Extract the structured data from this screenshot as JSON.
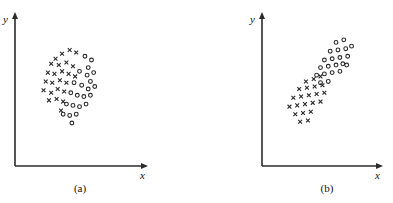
{
  "figure": {
    "background_color": "#ffffff",
    "ink_color": "#2b2b2b",
    "panels": [
      {
        "id": "a",
        "caption": "(a)",
        "caption_x": 80,
        "caption_y": 182,
        "axes": {
          "origin_x": 15,
          "origin_y": 166,
          "x_axis_end": 148,
          "y_axis_top": 12,
          "x_label": "x",
          "y_label": "y",
          "x_label_x": 140,
          "x_label_y": 170,
          "y_label_x": 3,
          "y_label_y": 14,
          "arrowheads": true,
          "ticks": false,
          "grid": false
        },
        "chart": {
          "description": "Two overlapping classes forming one roughly circular cloud; class x on the left, class o on the right, strongly intermixed."
        }
      },
      {
        "id": "b",
        "caption": "(b)",
        "caption_x": 327,
        "caption_y": 182,
        "axes": {
          "origin_x": 262,
          "origin_y": 166,
          "x_axis_end": 383,
          "y_axis_top": 12,
          "x_label": "x",
          "y_label": "y",
          "x_label_x": 375,
          "x_label_y": 170,
          "y_label_x": 250,
          "y_label_y": 14,
          "arrowheads": true,
          "ticks": false,
          "grid": false
        },
        "chart": {
          "description": "Two classes forming one elongated diagonal cloud; class x at the lower-left end, class o at the upper-right end, well separated along the major axis."
        }
      }
    ]
  },
  "chart_data": [
    {
      "type": "scatter",
      "panel": "a",
      "title": "(a)",
      "xlabel": "x",
      "ylabel": "y",
      "xlim": [
        0,
        100
      ],
      "ylim": [
        0,
        100
      ],
      "grid": false,
      "axis_ticks": false,
      "legend": null,
      "series": [
        {
          "name": "class-x",
          "marker": "x",
          "color": "#2b2b2b",
          "points": [
            [
              28,
              74
            ],
            [
              34,
              78
            ],
            [
              41,
              81
            ],
            [
              47,
              79
            ],
            [
              24,
              70
            ],
            [
              31,
              69
            ],
            [
              38,
              71
            ],
            [
              44,
              68
            ],
            [
              21,
              63
            ],
            [
              27,
              62
            ],
            [
              34,
              64
            ],
            [
              40,
              62
            ],
            [
              46,
              60
            ],
            [
              19,
              56
            ],
            [
              25,
              55
            ],
            [
              32,
              57
            ],
            [
              38,
              55
            ],
            [
              17,
              49
            ],
            [
              24,
              47
            ],
            [
              30,
              50
            ],
            [
              36,
              48
            ],
            [
              22,
              41
            ],
            [
              29,
              42
            ],
            [
              35,
              40
            ],
            [
              33,
              33
            ]
          ]
        },
        {
          "name": "class-o",
          "marker": "o",
          "color": "#2b2b2b",
          "points": [
            [
              55,
              76
            ],
            [
              61,
              73
            ],
            [
              58,
              67
            ],
            [
              50,
              64
            ],
            [
              57,
              61
            ],
            [
              63,
              63
            ],
            [
              60,
              56
            ],
            [
              45,
              55
            ],
            [
              52,
              53
            ],
            [
              58,
              50
            ],
            [
              64,
              52
            ],
            [
              42,
              47
            ],
            [
              48,
              45
            ],
            [
              54,
              44
            ],
            [
              60,
              45
            ],
            [
              38,
              38
            ],
            [
              44,
              37
            ],
            [
              50,
              36
            ],
            [
              56,
              38
            ],
            [
              35,
              30
            ],
            [
              41,
              29
            ],
            [
              47,
              30
            ],
            [
              43,
              23
            ]
          ]
        }
      ]
    },
    {
      "type": "scatter",
      "panel": "b",
      "title": "(b)",
      "xlabel": "x",
      "ylabel": "y",
      "xlim": [
        0,
        100
      ],
      "ylim": [
        0,
        100
      ],
      "grid": false,
      "axis_ticks": false,
      "legend": null,
      "series": [
        {
          "name": "class-x",
          "marker": "x",
          "color": "#2b2b2b",
          "points": [
            [
              35,
              56
            ],
            [
              43,
              58
            ],
            [
              50,
              60
            ],
            [
              28,
              50
            ],
            [
              36,
              51
            ],
            [
              44,
              52
            ],
            [
              52,
              53
            ],
            [
              22,
              43
            ],
            [
              30,
              44
            ],
            [
              38,
              45
            ],
            [
              46,
              46
            ],
            [
              54,
              47
            ],
            [
              18,
              36
            ],
            [
              26,
              37
            ],
            [
              34,
              38
            ],
            [
              42,
              39
            ],
            [
              50,
              40
            ],
            [
              24,
              30
            ],
            [
              32,
              31
            ],
            [
              40,
              32
            ],
            [
              29,
              24
            ],
            [
              37,
              25
            ]
          ]
        },
        {
          "name": "class-o",
          "marker": "o",
          "color": "#2b2b2b",
          "points": [
            [
              66,
              87
            ],
            [
              74,
              89
            ],
            [
              60,
              80
            ],
            [
              68,
              81
            ],
            [
              76,
              82
            ],
            [
              82,
              84
            ],
            [
              54,
              73
            ],
            [
              62,
              74
            ],
            [
              70,
              75
            ],
            [
              78,
              76
            ],
            [
              50,
              67
            ],
            [
              58,
              68
            ],
            [
              66,
              69
            ],
            [
              73,
              70
            ],
            [
              77,
              69
            ],
            [
              46,
              61
            ],
            [
              54,
              62
            ],
            [
              62,
              63
            ],
            [
              70,
              64
            ],
            [
              50,
              55
            ],
            [
              58,
              56
            ]
          ]
        }
      ]
    }
  ]
}
